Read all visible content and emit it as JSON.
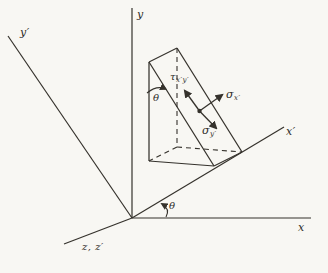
{
  "figure": {
    "background_color": "#f8f7f3",
    "ink_color": "#35322c"
  },
  "labels": {
    "axis_y": "y",
    "axis_y_prime": "y′",
    "axis_x": "x",
    "axis_x_prime": "x′",
    "axis_z": "z, z′",
    "theta_origin": "θ",
    "theta_wedge": "θ",
    "tau": {
      "base": "τ",
      "sub": "x′y′"
    },
    "sigma_x": {
      "base": "σ",
      "sub": "x′"
    },
    "sigma_y": {
      "base": "σ",
      "sub": "y′"
    }
  }
}
